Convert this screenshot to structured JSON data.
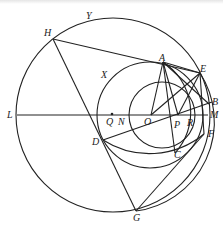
{
  "diagram": {
    "type": "geometry",
    "circles": [
      {
        "name": "big-circle",
        "label": "Y",
        "cx": 113,
        "cy": 115,
        "r": 97
      },
      {
        "name": "middle-circle",
        "label": "X",
        "cx": 150,
        "cy": 115,
        "r": 53
      },
      {
        "name": "small-circle",
        "cx": 162,
        "cy": 115,
        "r": 33
      },
      {
        "name": "arc-circle-1",
        "cx": 120,
        "cy": 100,
        "r": 86
      },
      {
        "name": "arc-circle-2",
        "cx": 135,
        "cy": 95,
        "r": 72
      }
    ],
    "points": {
      "H": {
        "x": 53,
        "y": 39
      },
      "Y": {
        "x": 88,
        "y": 15
      },
      "X": {
        "x": 106,
        "y": 75
      },
      "A": {
        "x": 163,
        "y": 62
      },
      "E": {
        "x": 200,
        "y": 73
      },
      "B": {
        "x": 209,
        "y": 104
      },
      "M": {
        "x": 208,
        "y": 115
      },
      "F": {
        "x": 204,
        "y": 134
      },
      "L": {
        "x": 17,
        "y": 115
      },
      "Q": {
        "x": 112,
        "y": 115
      },
      "N": {
        "x": 129,
        "y": 115
      },
      "O": {
        "x": 151,
        "y": 115
      },
      "P": {
        "x": 178,
        "y": 115
      },
      "R": {
        "x": 193,
        "y": 115
      },
      "D": {
        "x": 103,
        "y": 140
      },
      "C": {
        "x": 175,
        "y": 153
      },
      "G": {
        "x": 136,
        "y": 211
      }
    },
    "labels": [
      {
        "text": "H",
        "x": 44,
        "y": 28
      },
      {
        "text": "Y",
        "x": 86,
        "y": 11
      },
      {
        "text": "X",
        "x": 101,
        "y": 70
      },
      {
        "text": "A",
        "x": 159,
        "y": 53
      },
      {
        "text": "E",
        "x": 200,
        "y": 64
      },
      {
        "text": "B",
        "x": 212,
        "y": 97
      },
      {
        "text": "M",
        "x": 210,
        "y": 110
      },
      {
        "text": "F",
        "x": 208,
        "y": 129
      },
      {
        "text": "L",
        "x": 7,
        "y": 110
      },
      {
        "text": "Q",
        "x": 106,
        "y": 117
      },
      {
        "text": "N",
        "x": 118,
        "y": 117
      },
      {
        "text": "O",
        "x": 144,
        "y": 117
      },
      {
        "text": "P",
        "x": 174,
        "y": 120
      },
      {
        "text": "R",
        "x": 187,
        "y": 118
      },
      {
        "text": "D",
        "x": 92,
        "y": 137
      },
      {
        "text": "C",
        "x": 174,
        "y": 150
      },
      {
        "text": "G",
        "x": 133,
        "y": 213
      }
    ]
  }
}
